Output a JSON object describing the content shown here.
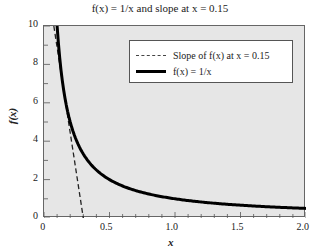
{
  "chart_data": {
    "type": "line",
    "title": "f(x) = 1/x and slope at x = 0.15",
    "xlabel": "x",
    "ylabel": "f(x)",
    "xlim": [
      0,
      2.0
    ],
    "ylim": [
      0,
      10
    ],
    "xticks": [
      "0",
      "0.5",
      "1.0",
      "1.5",
      "2.0"
    ],
    "yticks": [
      "0",
      "2",
      "4",
      "6",
      "8",
      "10"
    ],
    "grid": false,
    "legend_position": "upper right",
    "series": [
      {
        "name": "Slope of f(x) at x = 0.15",
        "style": "dashed",
        "x": [
          0.075,
          0.3
        ],
        "y": [
          10,
          0
        ]
      },
      {
        "name": "f(x) = 1/x",
        "style": "solid-thick",
        "x": [
          0.1,
          0.15,
          0.2,
          0.25,
          0.3,
          0.4,
          0.5,
          0.75,
          1.0,
          1.25,
          1.5,
          1.75,
          2.0
        ],
        "y": [
          10,
          6.667,
          5,
          4,
          3.333,
          2.5,
          2,
          1.333,
          1,
          0.8,
          0.667,
          0.571,
          0.5
        ]
      }
    ]
  },
  "labels": {
    "title": "f(x) = 1/x and slope at x = 0.15",
    "xlabel": "x",
    "ylabel": "f(x)",
    "legend_slope": "Slope of f(x) at x = 0.15",
    "legend_fx": "f(x) = 1/x"
  }
}
